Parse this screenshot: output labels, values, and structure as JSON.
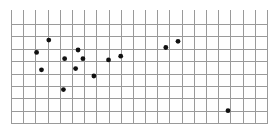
{
  "chart_data": {
    "type": "scatter",
    "title": "",
    "xlabel": "",
    "ylabel": "",
    "grid": true,
    "legend": null,
    "xlim": [
      0,
      21
    ],
    "ylim": [
      0,
      8
    ],
    "x_ticks_count": 22,
    "y_gridlines_count": 9,
    "units": "grid cells (x right from left edge, y up from bottom edge)",
    "points": [
      {
        "x": 3.1,
        "y": 6.7
      },
      {
        "x": 2.1,
        "y": 5.7
      },
      {
        "x": 5.5,
        "y": 5.9
      },
      {
        "x": 4.4,
        "y": 5.2
      },
      {
        "x": 5.9,
        "y": 5.2
      },
      {
        "x": 2.5,
        "y": 4.3
      },
      {
        "x": 5.3,
        "y": 4.4
      },
      {
        "x": 6.8,
        "y": 3.8
      },
      {
        "x": 4.3,
        "y": 2.7
      },
      {
        "x": 8.0,
        "y": 5.1
      },
      {
        "x": 9.0,
        "y": 5.4
      },
      {
        "x": 12.7,
        "y": 6.1
      },
      {
        "x": 13.7,
        "y": 6.6
      },
      {
        "x": 17.8,
        "y": 1.0
      }
    ],
    "colors": {
      "grid": "#9a9a9a",
      "point": "#111111",
      "background": "#ffffff"
    }
  },
  "layout": {
    "left": 11,
    "right": 267,
    "top": 24,
    "bottom": 123,
    "tick_top": 10,
    "point_radius": 2.4
  }
}
